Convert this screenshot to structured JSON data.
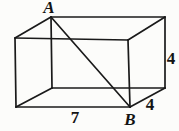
{
  "figure": {
    "background": "#fcfcfa",
    "stroke_color": "#1a1a1a",
    "stroke_width": 1.7,
    "vertices": {
      "front_top_left": [
        15,
        38
      ],
      "front_top_right": [
        128,
        40
      ],
      "front_bottom_left": [
        16,
        107
      ],
      "front_bottom_right": [
        130,
        107
      ],
      "back_top_left": [
        51,
        17
      ],
      "back_top_right": [
        165,
        17
      ],
      "back_bottom_left": [
        52,
        88
      ],
      "back_bottom_right": [
        165,
        88
      ]
    },
    "edges": [
      {
        "name": "edge-top-back",
        "from": "back_top_left",
        "to": "back_top_right"
      },
      {
        "name": "edge-top-left-slant",
        "from": "front_top_left",
        "to": "back_top_left"
      },
      {
        "name": "edge-top-right-slant",
        "from": "front_top_right",
        "to": "back_top_right"
      },
      {
        "name": "edge-top-front",
        "from": "front_top_left",
        "to": "front_top_right"
      },
      {
        "name": "edge-front-left",
        "from": "front_top_left",
        "to": "front_bottom_left"
      },
      {
        "name": "edge-front-right",
        "from": "front_top_right",
        "to": "front_bottom_right"
      },
      {
        "name": "edge-bottom-front",
        "from": "front_bottom_left",
        "to": "front_bottom_right"
      },
      {
        "name": "edge-back-left",
        "from": "back_top_left",
        "to": "back_bottom_left"
      },
      {
        "name": "edge-back-right",
        "from": "back_top_right",
        "to": "back_bottom_right"
      },
      {
        "name": "edge-bottom-back",
        "from": "back_bottom_left",
        "to": "back_bottom_right"
      },
      {
        "name": "edge-bottom-left-slant",
        "from": "front_bottom_left",
        "to": "back_bottom_left"
      },
      {
        "name": "edge-bottom-right-slant",
        "from": "front_bottom_right",
        "to": "back_bottom_right"
      },
      {
        "name": "space-diagonal-ab",
        "from": "back_top_left",
        "to": "front_bottom_right"
      }
    ],
    "labels": [
      {
        "name": "vertex-label-a",
        "text": "A",
        "x": 49,
        "y": 13,
        "style": "vertex-label"
      },
      {
        "name": "vertex-label-b",
        "text": "B",
        "x": 130,
        "y": 125,
        "style": "vertex-label"
      },
      {
        "name": "width-label",
        "text": "7",
        "x": 75,
        "y": 123,
        "style": "dim-label"
      },
      {
        "name": "height-label",
        "text": "4",
        "x": 171,
        "y": 64,
        "style": "dim-label"
      },
      {
        "name": "depth-label",
        "text": "4",
        "x": 150,
        "y": 110,
        "style": "dim-label"
      }
    ]
  }
}
